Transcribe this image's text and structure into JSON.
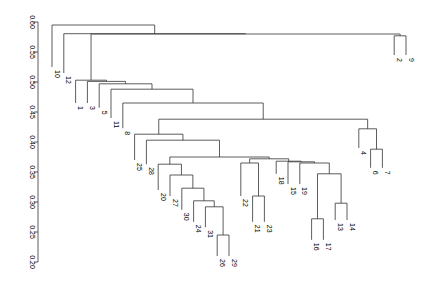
{
  "chart_data": {
    "type": "dendrogram",
    "title": "",
    "xlabel": "",
    "ylabel": "",
    "ylim": [
      0.2,
      0.6
    ],
    "y_ticks": [
      "0.20",
      "0.25",
      "0.30",
      "0.35",
      "0.40",
      "0.45",
      "0.50",
      "0.55",
      "0.60"
    ],
    "leaf_order": [
      "10",
      "12",
      "1",
      "3",
      "5",
      "11",
      "8",
      "25",
      "28",
      "20",
      "27",
      "30",
      "24",
      "31",
      "26",
      "29",
      "22",
      "21",
      "23",
      "18",
      "15",
      "19",
      "16",
      "17",
      "13",
      "14",
      "4",
      "6",
      "7",
      "2",
      "9"
    ],
    "merges": [
      {
        "id": "m_26_29",
        "left": "26",
        "right": "29",
        "height": 0.245
      },
      {
        "id": "m_16_17",
        "left": "16",
        "right": "17",
        "height": 0.272
      },
      {
        "id": "m_31",
        "left": "31",
        "right": "m_26_29",
        "height": 0.292
      },
      {
        "id": "m_13_14",
        "left": "13",
        "right": "14",
        "height": 0.298
      },
      {
        "id": "m_24",
        "left": "24",
        "right": "m_31",
        "height": 0.302
      },
      {
        "id": "m_21_23",
        "left": "21",
        "right": "23",
        "height": 0.31
      },
      {
        "id": "m_30",
        "left": "30",
        "right": "m_24",
        "height": 0.323
      },
      {
        "id": "m_1617_1314",
        "left": "m_16_17",
        "right": "m_13_14",
        "height": 0.347
      },
      {
        "id": "m_27",
        "left": "27",
        "right": "m_30",
        "height": 0.345
      },
      {
        "id": "m_6_7",
        "left": "6",
        "right": "7",
        "height": 0.388
      },
      {
        "id": "m_19",
        "left": "19",
        "right": "m_1617_1314",
        "height": 0.365
      },
      {
        "id": "m_15",
        "left": "15",
        "right": "m_19",
        "height": 0.367
      },
      {
        "id": "m_22",
        "left": "22",
        "right": "m_21_23",
        "height": 0.365
      },
      {
        "id": "m_18",
        "left": "18",
        "right": "m_15",
        "height": 0.368
      },
      {
        "id": "m_20",
        "left": "20",
        "right": "m_27",
        "height": 0.363
      },
      {
        "id": "m_22_18",
        "left": "m_22",
        "right": "m_18",
        "height": 0.372
      },
      {
        "id": "m_20_22",
        "left": "m_20",
        "right": "m_22_18",
        "height": 0.375
      },
      {
        "id": "m_28",
        "left": "28",
        "right": "m_20_22",
        "height": 0.403
      },
      {
        "id": "m_25",
        "left": "25",
        "right": "m_28",
        "height": 0.413
      },
      {
        "id": "m_4",
        "left": "4",
        "right": "m_6_7",
        "height": 0.422
      },
      {
        "id": "m_25_4",
        "left": "m_25",
        "right": "m_4",
        "height": 0.438
      },
      {
        "id": "m_8",
        "left": "8",
        "right": "m_25_4",
        "height": 0.465
      },
      {
        "id": "m_11",
        "left": "11",
        "right": "m_8",
        "height": 0.488
      },
      {
        "id": "m_5",
        "left": "5",
        "right": "m_11",
        "height": 0.497
      },
      {
        "id": "m_3",
        "left": "3",
        "right": "m_5",
        "height": 0.501
      },
      {
        "id": "m_1",
        "left": "1",
        "right": "m_3",
        "height": 0.503
      },
      {
        "id": "m_2_9",
        "left": "2",
        "right": "9",
        "height": 0.577
      },
      {
        "id": "m_1_29",
        "left": "m_1",
        "right": "m_2_9",
        "height": 0.58
      },
      {
        "id": "m_12",
        "left": "12",
        "right": "m_1_29",
        "height": 0.5805
      },
      {
        "id": "m_10",
        "left": "10",
        "right": "m_12",
        "height": 0.595
      }
    ],
    "leaf_label_bottom": {
      "10": 0.525,
      "12": 0.515,
      "1": 0.465,
      "3": 0.465,
      "5": 0.457,
      "11": 0.44,
      "8": 0.423,
      "25": 0.37,
      "28": 0.363,
      "20": 0.32,
      "27": 0.31,
      "30": 0.287,
      "24": 0.267,
      "31": 0.258,
      "26": 0.21,
      "29": 0.21,
      "22": 0.31,
      "21": 0.267,
      "23": 0.267,
      "18": 0.347,
      "15": 0.33,
      "19": 0.33,
      "16": 0.237,
      "17": 0.237,
      "13": 0.27,
      "14": 0.27,
      "4": 0.39,
      "6": 0.357,
      "7": 0.357,
      "2": 0.545,
      "9": 0.545
    }
  }
}
